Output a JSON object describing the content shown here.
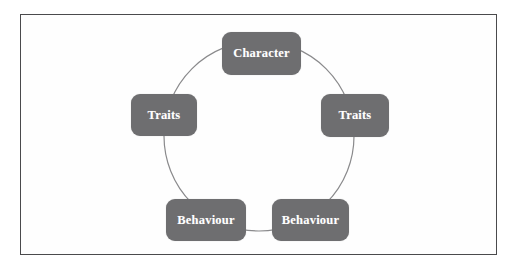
{
  "diagram": {
    "type": "cycle",
    "shape": "circle",
    "circle": {
      "center_x": 259,
      "center_y": 136,
      "radius": 95,
      "stroke_color": "#8a8a8c",
      "stroke_width": 1
    },
    "style": {
      "node_fill": "#6e6e70",
      "node_text_color": "#ffffff",
      "frame_border_color": "#4a4a4c",
      "background_color": "#ffffff"
    },
    "nodes": [
      {
        "id": "character",
        "label": "Character",
        "position": "top"
      },
      {
        "id": "traits-right",
        "label": "Traits",
        "position": "right"
      },
      {
        "id": "behaviour-right",
        "label": "Behaviour",
        "position": "bottom-right"
      },
      {
        "id": "behaviour-left",
        "label": "Behaviour",
        "position": "bottom-left"
      },
      {
        "id": "traits-left",
        "label": "Traits",
        "position": "left"
      }
    ]
  }
}
